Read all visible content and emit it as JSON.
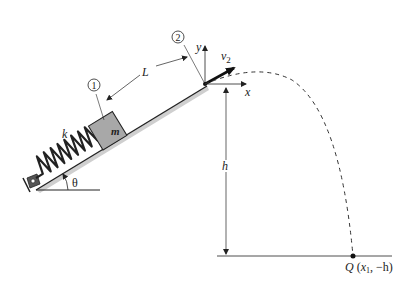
{
  "diagram": {
    "type": "physics-mechanics",
    "labels": {
      "spring_constant": "k",
      "mass": "m",
      "angle": "θ",
      "distance": "L",
      "position_1": "1",
      "position_2": "2",
      "y_axis": "y",
      "x_axis": "x",
      "velocity": "v",
      "velocity_subscript": "2",
      "height": "h",
      "landing_point": "Q",
      "landing_coords_open": "(",
      "landing_x": "x",
      "landing_x_sub": "1",
      "landing_coords_rest": ", −h)"
    },
    "colors": {
      "line": "#222222",
      "block_fill": "#a8a8a8",
      "ramp_shadow": "#bbbbbb",
      "background": "#ffffff"
    }
  }
}
